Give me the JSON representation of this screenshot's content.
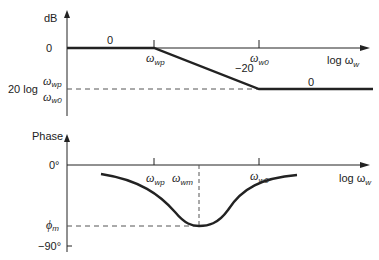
{
  "figure": {
    "magnitude_plot": {
      "y_axis_label": "dB",
      "x_axis_label": "log ω",
      "x_axis_label_sub": "w",
      "y_tick_zero": "0",
      "y_tick_low_prefix": "20 log",
      "y_tick_low_num": "ω",
      "y_tick_low_num_sub": "wp",
      "y_tick_low_den": "ω",
      "y_tick_low_den_sub": "w0",
      "freq_mark_1": "ω",
      "freq_mark_1_sub": "wp",
      "freq_mark_2": "ω",
      "freq_mark_2_sub": "w0",
      "slope_labels": [
        "0",
        "−20",
        "0"
      ]
    },
    "phase_plot": {
      "y_axis_label": "Phase",
      "x_axis_label": "log ω",
      "x_axis_label_sub": "w",
      "y_tick_zero": "0°",
      "y_tick_min": "−90°",
      "y_tick_phim": "ϕ",
      "y_tick_phim_sub": "m",
      "freq_mark_1": "ω",
      "freq_mark_1_sub": "wp",
      "freq_mark_m": "ω",
      "freq_mark_m_sub": "wm",
      "freq_mark_2": "ω",
      "freq_mark_2_sub": "w0"
    },
    "colors": {
      "line": "#222222",
      "dash": "#555555"
    }
  }
}
